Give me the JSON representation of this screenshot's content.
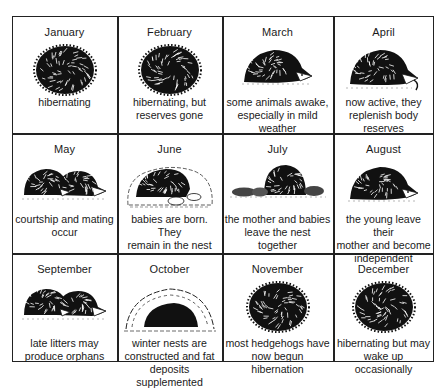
{
  "grid": {
    "rows": 3,
    "columns": 4
  },
  "months": [
    {
      "name": "January",
      "description": [
        "hibernating"
      ],
      "illustration": "curled-hedgehog-icon"
    },
    {
      "name": "February",
      "description": [
        "hibernating, but",
        "reserves gone"
      ],
      "illustration": "curled-hedgehog-icon"
    },
    {
      "name": "March",
      "description": [
        "some animals awake,",
        "especially in mild",
        "weather"
      ],
      "illustration": "hedgehog-side-icon"
    },
    {
      "name": "April",
      "description": [
        "now active, they",
        "replenish body",
        "reserves"
      ],
      "illustration": "hedgehog-eating-icon"
    },
    {
      "name": "May",
      "description": [
        "courtship and mating",
        "occur"
      ],
      "illustration": "two-hedgehogs-icon"
    },
    {
      "name": "June",
      "description": [
        "babies are born. They",
        "remain in the nest"
      ],
      "illustration": "hedgehog-nest-icon"
    },
    {
      "name": "July",
      "description": [
        "the mother and babies",
        "leave the nest together"
      ],
      "illustration": "hedgehog-family-icon"
    },
    {
      "name": "August",
      "description": [
        "the young leave their",
        "mother and become",
        "independent"
      ],
      "illustration": "hedgehog-side-icon"
    },
    {
      "name": "September",
      "description": [
        "late litters may",
        "produce orphans"
      ],
      "illustration": "two-hedgehogs-icon"
    },
    {
      "name": "October",
      "description": [
        "winter nests are",
        "constructed and fat",
        "deposits supplemented"
      ],
      "illustration": "winter-nest-icon"
    },
    {
      "name": "November",
      "description": [
        "most hedgehogs have",
        "now begun hibernation"
      ],
      "illustration": "curled-hedgehog-icon"
    },
    {
      "name": "December",
      "description": [
        "hibernating but may",
        "wake up occasionally"
      ],
      "illustration": "curled-hedgehog-icon"
    }
  ]
}
